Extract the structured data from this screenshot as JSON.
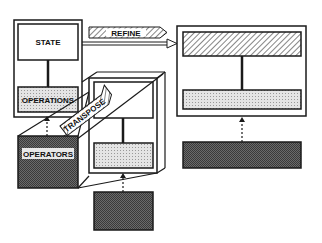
{
  "labels": {
    "state": "STATE",
    "operations": "OPERATIONS",
    "operators": "OPERATORS",
    "refine": "REFINE",
    "transpose": "TRANSPOSE"
  },
  "colors": {
    "stroke": "#1a1a1a",
    "dark_fill": "#5e5e5e",
    "light_fill": "#d9d9d9",
    "hatch": "#8a8a8a",
    "background": "#ffffff"
  }
}
